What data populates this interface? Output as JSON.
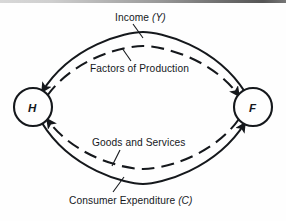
{
  "figure": {
    "type": "circular-flow-diagram",
    "title_text": "",
    "background_color": "#fefefe",
    "ink_color": "#15181c",
    "nodes": [
      {
        "id": "households",
        "letter": "H",
        "cx": 33,
        "cy": 107,
        "r": 19,
        "italic": true
      },
      {
        "id": "firms",
        "letter": "F",
        "cx": 253,
        "cy": 107,
        "r": 19,
        "italic": true
      }
    ],
    "labels": [
      {
        "id": "income",
        "text_plain": "Income ",
        "text_italic": "(Y)",
        "full": "Income (Y)"
      },
      {
        "id": "factors",
        "text_plain": "Factors of Production",
        "text_italic": "",
        "full": "Factors of Production"
      },
      {
        "id": "goods",
        "text_plain": "Goods and Services",
        "text_italic": "",
        "full": "Goods and Services"
      },
      {
        "id": "consumer",
        "text_plain": "Consumer  Expenditure ",
        "text_italic": "(C)",
        "full": "Consumer  Expenditure (C)"
      }
    ],
    "flows": [
      {
        "id": "income-flow",
        "style": "solid",
        "from": "firms",
        "to": "households",
        "direction": "right-to-left",
        "position": "upper-outer",
        "label": "Income (Y)"
      },
      {
        "id": "factors-flow",
        "style": "dashed",
        "from": "households",
        "to": "firms",
        "direction": "left-to-right",
        "position": "upper-inner",
        "label": "Factors of Production"
      },
      {
        "id": "goods-flow",
        "style": "dashed",
        "from": "firms",
        "to": "households",
        "direction": "right-to-left",
        "position": "lower-inner",
        "label": "Goods and Services"
      },
      {
        "id": "expenditure-flow",
        "style": "solid",
        "from": "households",
        "to": "firms",
        "direction": "left-to-right",
        "position": "lower-outer",
        "label": "Consumer Expenditure (C)"
      }
    ],
    "arrowheads": [
      {
        "id": "arrow-into-h-top",
        "target": "households",
        "points": "down-left"
      },
      {
        "id": "arrow-into-h-bottom",
        "target": "households",
        "points": "up-left"
      },
      {
        "id": "arrow-into-f-top",
        "target": "firms",
        "points": "down-right"
      },
      {
        "id": "arrow-into-f-bottom",
        "target": "firms",
        "points": "up-right"
      }
    ]
  }
}
